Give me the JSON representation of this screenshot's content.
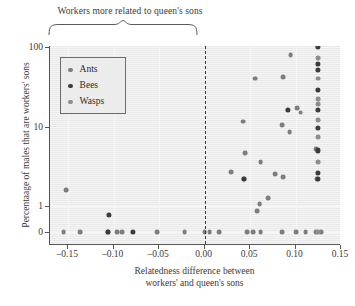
{
  "annotation": {
    "brace_label": "Workers more related to queen's sons",
    "brace_icon": "curly-brace-down"
  },
  "legend": {
    "position": "top-left-inside",
    "entries": [
      {
        "label": "Ants",
        "color": "#7d7d7d"
      },
      {
        "label": "Bees",
        "color": "#3c3c3c"
      },
      {
        "label": "Wasps",
        "color": "#8e8e8e"
      }
    ]
  },
  "axes": {
    "ylabel": "Percentaage of males that are workers' sons",
    "xlabel_line1": "Relatedness difference between",
    "xlabel_line2": "workers' and queen's sons",
    "ytick_labels": [
      "100",
      "10",
      "1",
      "0"
    ],
    "xtick_labels": [
      "–0.15",
      "–0.10",
      "–0.05",
      "0.00",
      "0.05",
      "0.10",
      "0.15"
    ]
  },
  "chart_data": {
    "type": "scatter",
    "title": "",
    "xlabel": "Relatedness difference between workers' and queen's sons",
    "ylabel": "Percentaage of males that are workers' sons",
    "xlim": [
      -0.17,
      0.15
    ],
    "ylim_note": "log-like y axis with ticks 0, 1, 10, 100; 0 placed below 1 on a break",
    "yticks": [
      0,
      1,
      10,
      100
    ],
    "xticks": [
      -0.15,
      -0.1,
      -0.05,
      0.0,
      0.05,
      0.1,
      0.15
    ],
    "grid": true,
    "reference_line": {
      "x": 0.0,
      "style": "dashed",
      "color": "#3b3b3b"
    },
    "legend_position": "upper left",
    "annotations": [
      {
        "text": "Workers more related to queen's sons",
        "x_range": [
          -0.17,
          0.0
        ],
        "position": "above-axis"
      }
    ],
    "series": [
      {
        "name": "Ants",
        "color": "#7d7d7d",
        "points": [
          [
            -0.155,
            0
          ],
          [
            -0.137,
            0
          ],
          [
            -0.106,
            0
          ],
          [
            -0.0965,
            0
          ],
          [
            -0.0905,
            0
          ],
          [
            -0.052,
            0
          ],
          [
            -0.022,
            0
          ],
          [
            0.0,
            0
          ],
          [
            0.0055,
            0
          ],
          [
            0.016,
            0
          ],
          [
            0.047,
            0
          ],
          [
            0.0535,
            0
          ],
          [
            0.0615,
            0
          ],
          [
            0.085,
            0
          ],
          [
            0.101,
            0
          ],
          [
            0.111,
            0
          ],
          [
            0.123,
            0
          ],
          [
            0.128,
            0
          ],
          [
            -0.152,
            1.6
          ],
          [
            0.0295,
            2.7
          ],
          [
            0.0435,
            2.2
          ],
          [
            0.0445,
            4.6
          ],
          [
            0.0425,
            11.5
          ],
          [
            0.058,
            0.62
          ],
          [
            0.0605,
            1.05
          ],
          [
            0.0615,
            3.6
          ],
          [
            0.0695,
            1.25
          ],
          [
            0.0775,
            2.5
          ],
          [
            0.0555,
            40
          ],
          [
            0.0865,
            2.3
          ],
          [
            0.0855,
            10.5
          ],
          [
            0.0865,
            42
          ],
          [
            0.0935,
            8.5
          ],
          [
            0.0945,
            79
          ],
          [
            0.1015,
            17
          ],
          [
            0.1055,
            15
          ],
          [
            0.1235,
            2.2
          ],
          [
            0.1225,
            5.2
          ]
        ]
      },
      {
        "name": "Bees",
        "color": "#3c3c3c",
        "points": [
          [
            -0.1065,
            0
          ],
          [
            -0.1055,
            0.35
          ],
          [
            -0.0785,
            0
          ],
          [
            0.0435,
            2.2
          ],
          [
            0.0915,
            16
          ],
          [
            0.125,
            100
          ],
          [
            0.125,
            62
          ],
          [
            0.125,
            52
          ],
          [
            0.125,
            29
          ],
          [
            0.125,
            16
          ],
          [
            0.125,
            9.5
          ],
          [
            0.125,
            5.0
          ],
          [
            0.125,
            2.6
          ],
          [
            0.125,
            2.2
          ]
        ]
      },
      {
        "name": "Wasps",
        "color": "#8e8e8e",
        "points": [
          [
            0.125,
            72
          ],
          [
            0.125,
            40
          ],
          [
            0.125,
            22
          ],
          [
            0.125,
            19
          ],
          [
            0.125,
            12
          ],
          [
            0.125,
            7.4
          ],
          [
            0.125,
            3.6
          ],
          [
            0.1245,
            0
          ]
        ]
      }
    ]
  }
}
